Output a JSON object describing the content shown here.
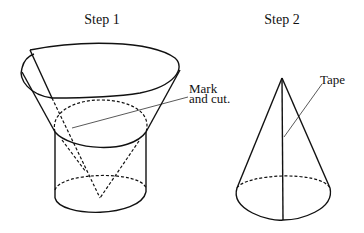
{
  "steps": [
    {
      "title": "Step 1",
      "annotation_line1": "Mark",
      "annotation_line2": "and cut."
    },
    {
      "title": "Step 2",
      "annotation": "Tape"
    }
  ],
  "colors": {
    "stroke": "#111111",
    "background": "#ffffff"
  }
}
